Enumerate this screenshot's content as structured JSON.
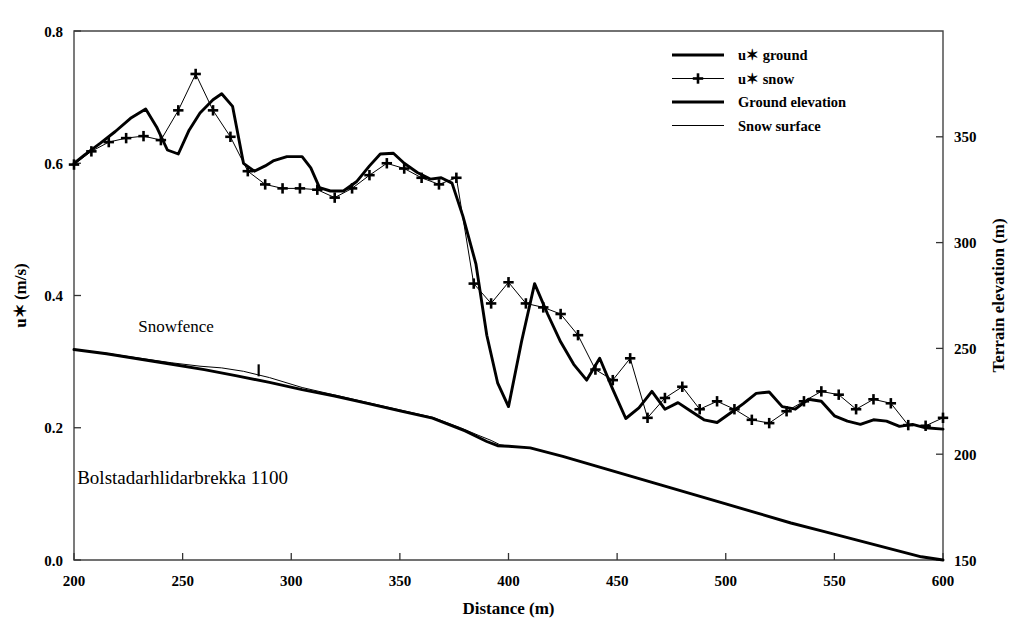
{
  "chart_data": {
    "type": "line",
    "title": "",
    "annotations": [
      {
        "text": "Snowfence",
        "x": 247,
        "y_axis": "left",
        "y": 0.345
      },
      {
        "text": "Bolstadarhlidarbrekka 1100",
        "x": 250,
        "y_axis": "left",
        "y": 0.115
      }
    ],
    "xlabel": "Distance (m)",
    "ylabel": "u✶ (m/s)",
    "ylabel_right": "Terrain elevation (m)",
    "xlim": [
      200,
      600
    ],
    "ylim": [
      0.0,
      0.8
    ],
    "ylim_right": [
      150,
      400
    ],
    "xticks": [
      200,
      250,
      300,
      350,
      400,
      450,
      500,
      550,
      600
    ],
    "yticks": [
      "0.0",
      "0.2",
      "0.4",
      "0.6",
      "0.8"
    ],
    "yticks_right": [
      150,
      200,
      250,
      300,
      350
    ],
    "grid": false,
    "legend_position": "top-right",
    "series": [
      {
        "name": "u✶ ground",
        "axis": "left",
        "style": "thick-line",
        "marker": "none",
        "color": "#000000",
        "x": [
          200,
          205,
          212,
          219,
          226,
          233,
          238,
          243,
          248,
          253,
          258,
          264,
          268,
          273,
          278,
          283,
          288,
          292,
          298,
          305,
          309,
          313,
          318,
          324,
          330,
          336,
          341,
          347,
          352,
          358,
          364,
          369,
          374,
          379,
          385,
          390,
          395,
          400,
          406,
          412,
          418,
          424,
          430,
          436,
          442,
          448,
          454,
          460,
          466,
          472,
          478,
          484,
          490,
          496,
          502,
          508,
          514,
          520,
          526,
          532,
          538,
          544,
          550,
          556,
          562,
          568,
          574,
          580,
          586,
          592,
          600
        ],
        "y": [
          0.6,
          0.613,
          0.63,
          0.648,
          0.668,
          0.682,
          0.655,
          0.62,
          0.614,
          0.65,
          0.676,
          0.696,
          0.705,
          0.686,
          0.6,
          0.588,
          0.596,
          0.604,
          0.61,
          0.61,
          0.593,
          0.563,
          0.558,
          0.558,
          0.572,
          0.596,
          0.614,
          0.615,
          0.6,
          0.586,
          0.576,
          0.578,
          0.57,
          0.52,
          0.448,
          0.34,
          0.268,
          0.232,
          0.33,
          0.418,
          0.372,
          0.33,
          0.296,
          0.272,
          0.305,
          0.258,
          0.214,
          0.23,
          0.255,
          0.228,
          0.238,
          0.225,
          0.212,
          0.208,
          0.222,
          0.236,
          0.252,
          0.254,
          0.232,
          0.228,
          0.243,
          0.24,
          0.218,
          0.21,
          0.205,
          0.212,
          0.21,
          0.202,
          0.205,
          0.2,
          0.198
        ]
      },
      {
        "name": "u✶ snow",
        "axis": "left",
        "style": "thin-line",
        "marker": "plus",
        "color": "#000000",
        "x": [
          200,
          208,
          216,
          224,
          232,
          240,
          248,
          256,
          264,
          272,
          280,
          288,
          296,
          304,
          312,
          320,
          328,
          336,
          344,
          352,
          360,
          368,
          376,
          384,
          392,
          400,
          408,
          416,
          424,
          432,
          440,
          448,
          456,
          464,
          472,
          480,
          488,
          496,
          504,
          512,
          520,
          528,
          536,
          544,
          552,
          560,
          568,
          576,
          584,
          592,
          600
        ],
        "y": [
          0.598,
          0.618,
          0.632,
          0.638,
          0.641,
          0.635,
          0.68,
          0.735,
          0.68,
          0.64,
          0.588,
          0.568,
          0.562,
          0.562,
          0.56,
          0.548,
          0.562,
          0.582,
          0.6,
          0.592,
          0.578,
          0.568,
          0.578,
          0.418,
          0.388,
          0.42,
          0.388,
          0.382,
          0.372,
          0.34,
          0.288,
          0.272,
          0.305,
          0.215,
          0.245,
          0.262,
          0.228,
          0.24,
          0.228,
          0.212,
          0.207,
          0.225,
          0.24,
          0.255,
          0.25,
          0.228,
          0.243,
          0.237,
          0.204,
          0.203,
          0.215
        ]
      },
      {
        "name": "Ground elevation",
        "axis": "right",
        "style": "thick-line",
        "marker": "none",
        "color": "#000000",
        "x": [
          200,
          215,
          230,
          245,
          260,
          275,
          290,
          305,
          320,
          335,
          350,
          365,
          380,
          390,
          395,
          400,
          410,
          425,
          440,
          455,
          470,
          485,
          500,
          515,
          530,
          545,
          560,
          575,
          590,
          600
        ],
        "y": [
          249.5,
          247.5,
          245.0,
          242.5,
          240.0,
          237.0,
          234.0,
          230.5,
          227.5,
          224.0,
          220.5,
          217.0,
          211.0,
          206.0,
          204.0,
          203.8,
          203.0,
          199.0,
          194.5,
          190.0,
          185.5,
          181.0,
          176.5,
          172.0,
          167.5,
          163.5,
          159.5,
          155.5,
          151.5,
          150.0
        ]
      },
      {
        "name": "Snow surface",
        "axis": "right",
        "style": "thin-line",
        "marker": "none",
        "color": "#000000",
        "segments": [
          {
            "x": [
              200,
              215,
              230,
              245,
              258,
              268,
              278,
              290,
              305,
              320,
              335,
              350,
              365,
              378,
              386,
              392,
              396,
              400,
              410
            ],
            "y": [
              249.5,
              247.7,
              245.4,
              243.2,
              241.6,
              240.8,
              239.2,
              236.2,
              231.5,
              228.0,
              224.5,
              221.0,
              217.5,
              212.5,
              209.0,
              206.5,
              204.5,
              203.8,
              203.0
            ]
          }
        ]
      }
    ],
    "legend": [
      {
        "label": "u✶ ground",
        "style": "thick-line",
        "marker": "none"
      },
      {
        "label": "u✶ snow",
        "style": "thin-line",
        "marker": "plus"
      },
      {
        "label": "Ground elevation",
        "style": "thick-line",
        "marker": "none"
      },
      {
        "label": "Snow surface",
        "style": "thin-line",
        "marker": "none"
      }
    ]
  }
}
